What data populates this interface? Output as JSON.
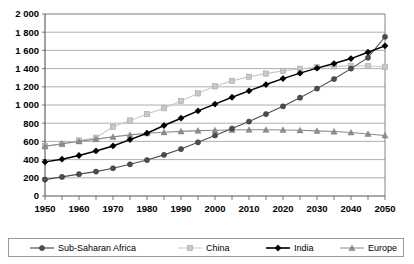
{
  "chart_data": {
    "type": "line",
    "title": "",
    "xlabel": "",
    "ylabel": "",
    "x": [
      1950,
      1955,
      1960,
      1965,
      1970,
      1975,
      1980,
      1985,
      1990,
      1995,
      2000,
      2005,
      2010,
      2015,
      2020,
      2025,
      2030,
      2035,
      2040,
      2045,
      2050
    ],
    "xlim": [
      1950,
      2050
    ],
    "ylim": [
      0,
      2000
    ],
    "ytick_step": 200,
    "xtick_step": 5,
    "xtick_label_step": 10,
    "grid": true,
    "legend_position": "bottom",
    "ytick_labels": [
      "0",
      "200",
      "400",
      "600",
      "800",
      "1 000",
      "1 200",
      "1 400",
      "1 600",
      "1 800",
      "2 000"
    ],
    "xtick_labels": [
      "1950",
      "1960",
      "1970",
      "1980",
      "1990",
      "2000",
      "2010",
      "2020",
      "2030",
      "2040",
      "2050"
    ],
    "series": [
      {
        "name": "Sub-Saharan Africa",
        "marker": "circle",
        "color": "#4d4d4d",
        "line_color": "#4d4d4d",
        "values": [
          180,
          210,
          240,
          268,
          305,
          348,
          395,
          452,
          516,
          590,
          665,
          742,
          818,
          900,
          985,
          1080,
          1180,
          1285,
          1400,
          1520,
          1750
        ]
      },
      {
        "name": "China",
        "marker": "square",
        "color": "#c8c8c8",
        "line_color": "#c8c8c8",
        "values": [
          550,
          570,
          610,
          640,
          760,
          830,
          900,
          965,
          1045,
          1128,
          1205,
          1265,
          1310,
          1345,
          1375,
          1398,
          1415,
          1425,
          1430,
          1428,
          1420
        ]
      },
      {
        "name": "India",
        "marker": "diamond",
        "color": "#000000",
        "line_color": "#000000",
        "values": [
          375,
          405,
          445,
          495,
          550,
          620,
          690,
          775,
          855,
          935,
          1010,
          1085,
          1155,
          1225,
          1290,
          1350,
          1405,
          1455,
          1510,
          1580,
          1650
        ]
      },
      {
        "name": "Europe",
        "marker": "triangle",
        "color": "#8c8c8c",
        "line_color": "#8c8c8c",
        "values": [
          545,
          575,
          600,
          625,
          650,
          672,
          690,
          700,
          710,
          718,
          722,
          726,
          728,
          728,
          726,
          722,
          716,
          708,
          698,
          682,
          665
        ]
      }
    ]
  },
  "legend": {
    "items": [
      {
        "label": "Sub-Saharan Africa"
      },
      {
        "label": "China"
      },
      {
        "label": "India"
      },
      {
        "label": "Europe"
      }
    ]
  }
}
